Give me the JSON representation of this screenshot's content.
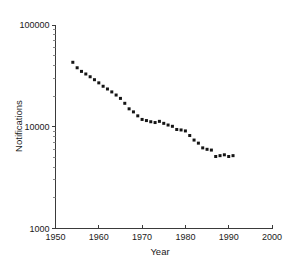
{
  "chart_data": {
    "type": "scatter",
    "title": "",
    "xlabel": "Year",
    "ylabel": "Notifications",
    "xlim": [
      1950,
      2000
    ],
    "ylim": [
      1000,
      100000
    ],
    "yscale": "log",
    "xscale": "linear",
    "grid": false,
    "legend": null,
    "xticks": [
      1950,
      1960,
      1970,
      1980,
      1990,
      2000
    ],
    "xticklabels": [
      "1950",
      "1960",
      "1970",
      "1980",
      "1990",
      "2000"
    ],
    "yticks": [
      1000,
      10000,
      100000
    ],
    "yticklabels": [
      "1000",
      "10000",
      "100000"
    ],
    "yminorticks": [
      2000,
      3000,
      4000,
      5000,
      6000,
      7000,
      8000,
      9000,
      20000,
      30000,
      40000,
      50000,
      60000,
      70000,
      80000,
      90000
    ],
    "marker": "square",
    "marker_color": "#151515",
    "marker_size": 3,
    "x": [
      1954,
      1955,
      1956,
      1957,
      1958,
      1959,
      1960,
      1961,
      1962,
      1963,
      1964,
      1965,
      1966,
      1967,
      1968,
      1969,
      1970,
      1971,
      1972,
      1973,
      1974,
      1975,
      1976,
      1977,
      1978,
      1979,
      1980,
      1981,
      1982,
      1983,
      1984,
      1985,
      1986,
      1987,
      1988,
      1989,
      1990,
      1991
    ],
    "values": [
      43000,
      38000,
      35000,
      33000,
      31000,
      29000,
      27000,
      25000,
      23500,
      22000,
      20500,
      19000,
      17000,
      15000,
      14000,
      12800,
      11800,
      11500,
      11200,
      11000,
      11300,
      10800,
      10400,
      10100,
      9400,
      9300,
      9100,
      8200,
      7400,
      6900,
      6200,
      6000,
      5900,
      5100,
      5200,
      5300,
      5100,
      5200
    ],
    "series_name": "Notifications"
  },
  "axis": {
    "y_title": "Notifications",
    "x_title": "Year"
  }
}
